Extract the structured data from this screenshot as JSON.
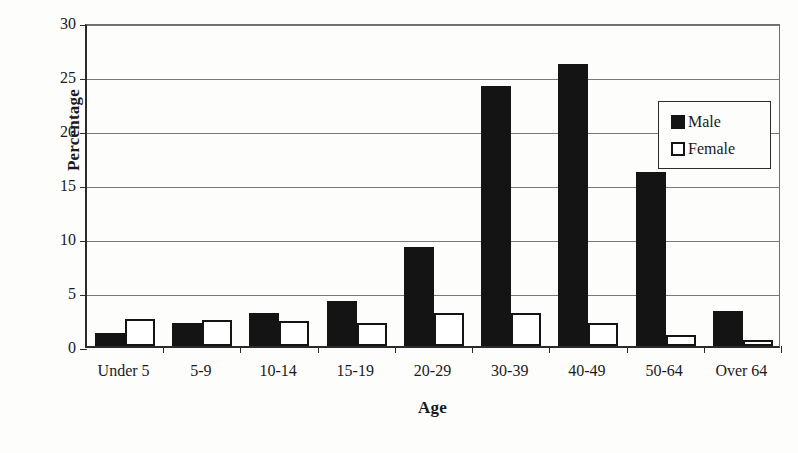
{
  "chart_data": {
    "type": "bar",
    "title": "",
    "xlabel": "Age",
    "ylabel": "Percentage",
    "categories": [
      "Under 5",
      "5-9",
      "10-14",
      "15-19",
      "20-29",
      "30-39",
      "40-49",
      "50-64",
      "Over 64"
    ],
    "series": [
      {
        "name": "Male",
        "color": "#141414",
        "values": [
          1.2,
          2.1,
          3.1,
          4.2,
          9.2,
          24.1,
          26.1,
          16.1,
          3.2
        ]
      },
      {
        "name": "Female",
        "color": "#ffffff",
        "values": [
          2.5,
          2.4,
          2.3,
          2.1,
          3.1,
          3.1,
          2.1,
          1.0,
          0.6
        ]
      }
    ],
    "ylim": [
      0,
      30
    ],
    "yticks": [
      0,
      5,
      10,
      15,
      20,
      25,
      30
    ],
    "ytick_labels": [
      "0",
      "5",
      "10",
      "15",
      "20",
      "25",
      "30"
    ],
    "grid": true,
    "legend_position": "upper right",
    "legend_entries": [
      "Male",
      "Female"
    ]
  }
}
